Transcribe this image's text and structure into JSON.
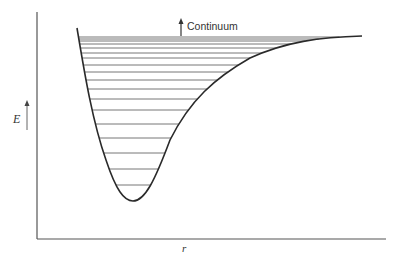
{
  "diagram": {
    "type": "potential-energy-curve",
    "y_axis_label": "E",
    "x_axis_label": "r",
    "continuum_label": "Continuum",
    "colors": {
      "curve": "#2a2a2a",
      "levels": "#555555",
      "axis": "#444444",
      "text": "#333333"
    },
    "well_minimum": {
      "x": 133,
      "y": 201
    },
    "asymptote_y": 36,
    "energy_level_ys": [
      37,
      39,
      41,
      44,
      48,
      53,
      58,
      65,
      72,
      80,
      89,
      99,
      110,
      124,
      138,
      153,
      169,
      185
    ]
  }
}
